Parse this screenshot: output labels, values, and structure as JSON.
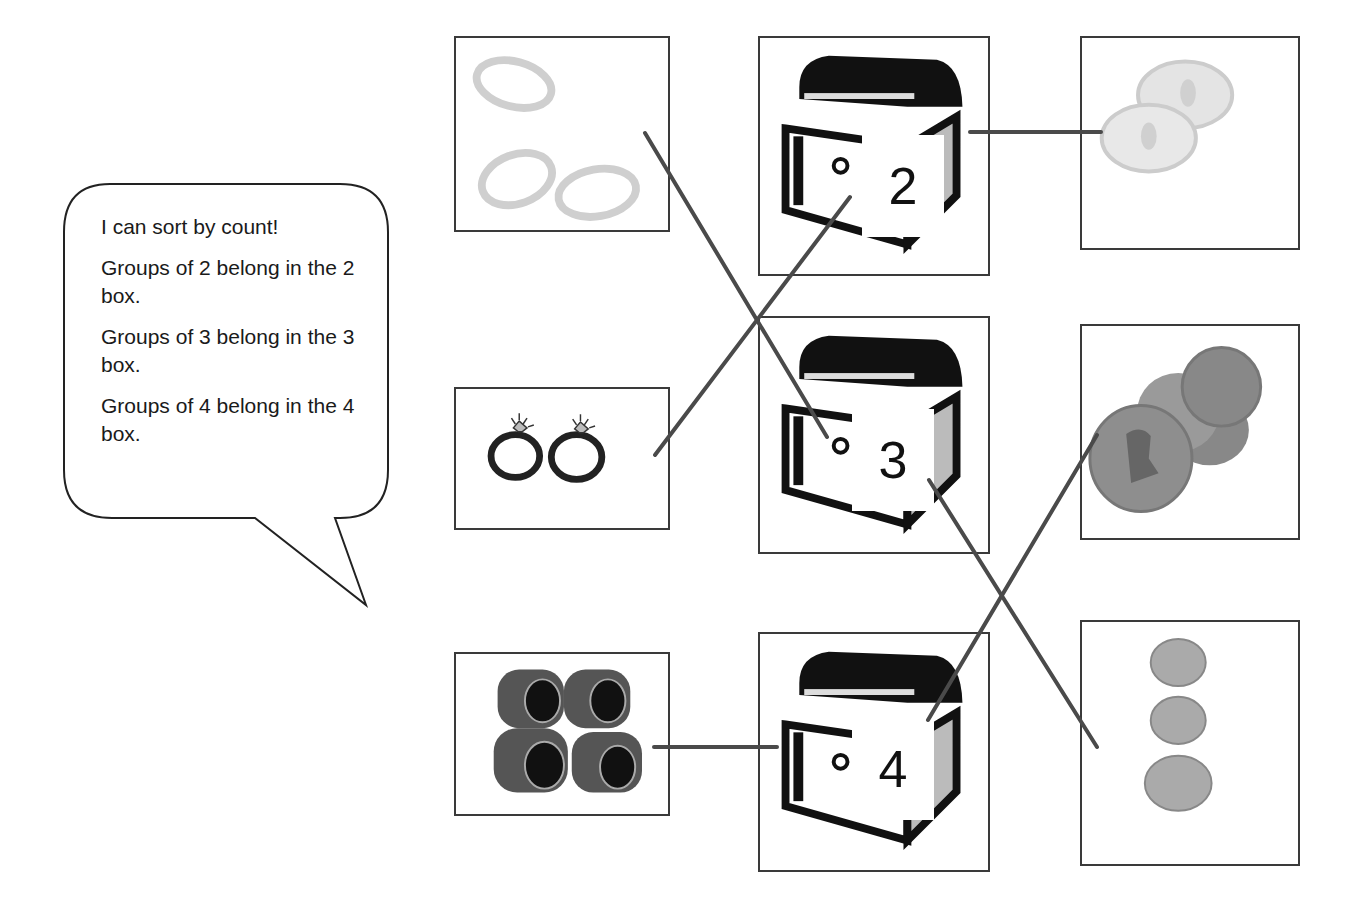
{
  "speech_bubble": {
    "lines": [
      "I can sort by count!",
      "Groups of 2 belong in the 2 box.",
      "Groups of 3 belong in the 3 box.",
      "Groups of 4 belong in the 4 box."
    ]
  },
  "left_column": [
    {
      "item": "rings",
      "count": 3,
      "description": "three plain gold rings"
    },
    {
      "item": "diamond-rings",
      "count": 2,
      "description": "two diamond engagement rings"
    },
    {
      "item": "class-rings",
      "count": 4,
      "description": "four class rings"
    }
  ],
  "middle_column": [
    {
      "item": "treasure-chest",
      "label": "2"
    },
    {
      "item": "treasure-chest",
      "label": "3"
    },
    {
      "item": "treasure-chest",
      "label": "4"
    }
  ],
  "right_column": [
    {
      "item": "silver-coins",
      "count": 2,
      "description": "two silver coins"
    },
    {
      "item": "copper-coins",
      "count": 4,
      "description": "four copper pennies"
    },
    {
      "item": "nickels",
      "count": 3,
      "description": "three coins stacked vertically"
    }
  ],
  "connections": [
    {
      "from": "three plain rings",
      "to": "chest 3"
    },
    {
      "from": "two diamond rings",
      "to": "chest 2"
    },
    {
      "from": "four class rings",
      "to": "chest 4"
    },
    {
      "from": "two silver coins",
      "to": "chest 2"
    },
    {
      "from": "four copper coins",
      "to": "chest 4"
    },
    {
      "from": "three coins",
      "to": "chest 3"
    }
  ],
  "colors": {
    "line": "#4a4a4a",
    "border": "#3a3a3a",
    "chest_dark": "#111111"
  }
}
